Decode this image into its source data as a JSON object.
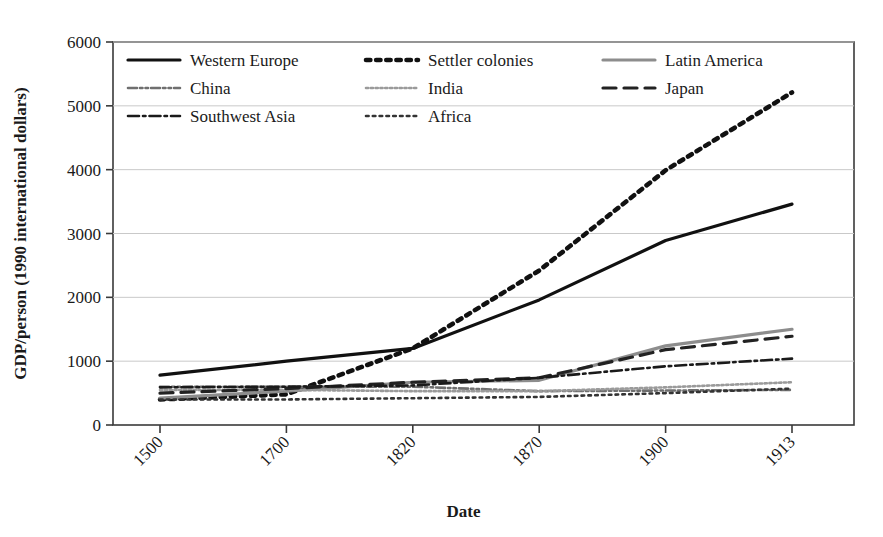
{
  "chart_data": {
    "type": "line",
    "title": "",
    "xlabel": "Date",
    "ylabel": "GDP/person (1990 international dollars)",
    "categories": [
      "1500",
      "1700",
      "1820",
      "1870",
      "1900",
      "1913"
    ],
    "x": [
      1500,
      1700,
      1820,
      1870,
      1900,
      1913
    ],
    "ylim": [
      0,
      6000
    ],
    "yticks": [
      0,
      1000,
      2000,
      3000,
      4000,
      5000,
      6000
    ],
    "ytick_labels": [
      "0",
      "1000",
      "2000",
      "3000",
      "4000",
      "5000",
      "6000"
    ],
    "grid": "horizontal",
    "legend_position": "top-left-inside",
    "series": [
      {
        "name": "Western Europe",
        "values": [
          780,
          1000,
          1200,
          1960,
          2890,
          3460
        ],
        "style": "solid",
        "color": "#111111",
        "width": 3.2
      },
      {
        "name": "Settler colonies",
        "values": [
          400,
          480,
          1200,
          2420,
          3990,
          5210
        ],
        "style": "dotted",
        "color": "#111111",
        "width": 4.6
      },
      {
        "name": "Latin America",
        "values": [
          420,
          530,
          670,
          700,
          1240,
          1500
        ],
        "style": "solid",
        "color": "#8d8d8d",
        "width": 3.2
      },
      {
        "name": "China",
        "values": [
          600,
          600,
          600,
          530,
          540,
          550
        ],
        "style": "dash-dot-dot",
        "color": "#6f6f6f",
        "width": 2.6
      },
      {
        "name": "India",
        "values": [
          550,
          550,
          530,
          530,
          590,
          670
        ],
        "style": "dense-dot",
        "color": "#9a9a9a",
        "width": 2.6
      },
      {
        "name": "Japan",
        "values": [
          500,
          570,
          670,
          740,
          1180,
          1390
        ],
        "style": "dashed",
        "color": "#222222",
        "width": 3.2
      },
      {
        "name": "Southwest Asia",
        "values": [
          590,
          600,
          620,
          740,
          920,
          1040
        ],
        "style": "dash-dot",
        "color": "#1a1a1a",
        "width": 2.6
      },
      {
        "name": "Africa",
        "values": [
          400,
          400,
          420,
          440,
          500,
          570
        ],
        "style": "fine-dot",
        "color": "#333333",
        "width": 2.6
      }
    ]
  },
  "legend": {
    "rows": [
      [
        "Western Europe",
        "Settler colonies",
        "Latin America"
      ],
      [
        "China",
        "India",
        "Japan"
      ],
      [
        "Southwest Asia",
        "Africa"
      ]
    ]
  }
}
